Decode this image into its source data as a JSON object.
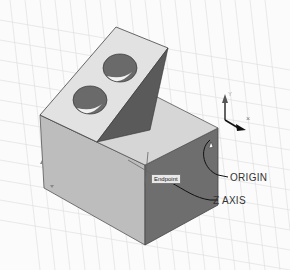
{
  "viewport": {
    "background": "#fbfbfb",
    "grid_color": "#d8d8d8",
    "faces": {
      "top": "#d6d6d6",
      "front": "#bdbdbd",
      "right": "#6e6e6e",
      "slope": "#e2e2e2",
      "slope_side": "#5a5a5a",
      "hole": "#6a6a6a"
    }
  },
  "annotations": {
    "origin_label": "ORIGIN",
    "z_axis_label": "Z AXIS",
    "tooltip": "Endpoint"
  },
  "ucs_icon": {
    "x_label": "X",
    "y_label": "Y"
  }
}
